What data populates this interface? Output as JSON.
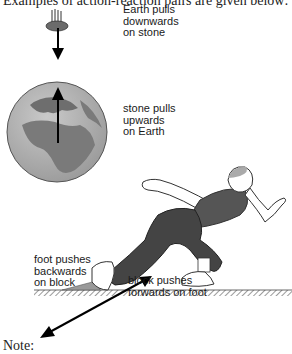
{
  "intro_text": "Examples of action-reaction pairs are given below:",
  "labels": {
    "earth_on_stone": [
      "Earth pulls",
      "downwards",
      "on stone"
    ],
    "stone_on_earth": [
      "stone pulls",
      "upwards",
      "on Earth"
    ],
    "foot_on_block": [
      "foot pushes",
      "backwards",
      "on block"
    ],
    "block_on_foot": [
      "block pushes",
      "forwards on foot"
    ]
  },
  "note_text": "Note:"
}
